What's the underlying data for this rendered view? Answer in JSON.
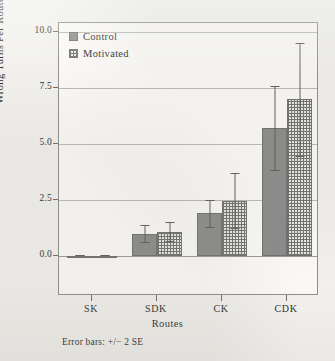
{
  "figure": {
    "background_color": "#f2f1ed",
    "plot_background_color": "#fbfaf7",
    "frame_color": "#8e8d87",
    "footnote": "Error bars: +/− 2 SE"
  },
  "legend": {
    "position": "inside-top-left",
    "entries": [
      {
        "label": "Control",
        "fill": "solid-gray",
        "color": "#8a8a8a"
      },
      {
        "label": "Motivated",
        "fill": "dotted-grid",
        "color": "#e9e8e3"
      }
    ]
  },
  "chart_data": {
    "type": "bar",
    "title": "",
    "subtitle": "",
    "xlabel": "Routes",
    "ylabel": "Wrong Turns Per Route",
    "categories": [
      "SK",
      "SDK",
      "CK",
      "CDK"
    ],
    "ylim": [
      0.0,
      10.0
    ],
    "yticks": [
      0.0,
      2.5,
      5.0,
      7.5,
      10.0
    ],
    "ytick_labels": [
      "0.0",
      "2.5",
      "5.0",
      "7.5",
      "10.0"
    ],
    "grid": true,
    "grid_axis": "y",
    "legend_entries": [
      "Control",
      "Motivated"
    ],
    "error_bar_note": "Error bars: +/− 2 SE",
    "series": [
      {
        "name": "Control",
        "values": [
          0.02,
          1.0,
          1.9,
          5.7
        ],
        "err_low": [
          0.0,
          0.6,
          1.25,
          3.8
        ],
        "err_high": [
          0.05,
          1.4,
          2.5,
          7.6
        ]
      },
      {
        "name": "Motivated",
        "values": [
          0.02,
          1.05,
          2.45,
          7.0
        ],
        "err_low": [
          0.0,
          0.6,
          1.2,
          4.4
        ],
        "err_high": [
          0.05,
          1.5,
          3.7,
          9.5
        ]
      }
    ]
  }
}
